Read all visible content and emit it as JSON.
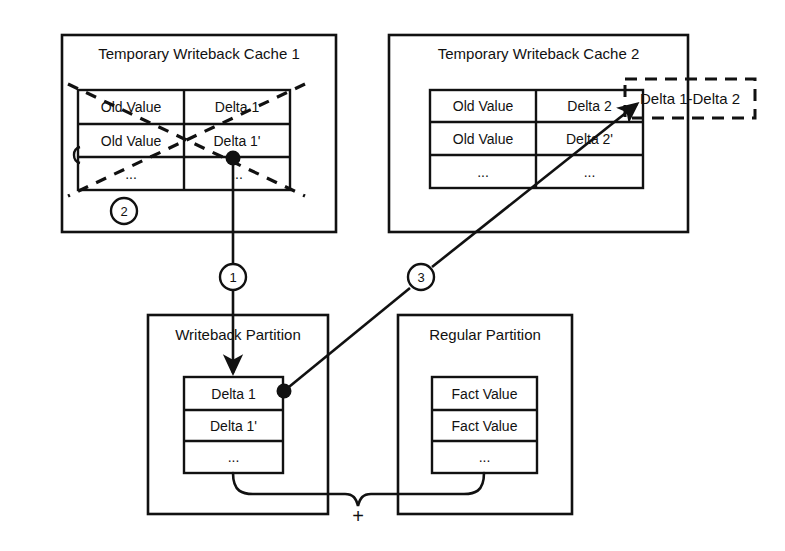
{
  "diagram": {
    "stroke_color": "#111111",
    "background_color": "#ffffff"
  },
  "caches": [
    {
      "id": "cache-1",
      "title": "Temporary Writeback Cache 1",
      "crossed_out": true,
      "step_badge": "2",
      "table": {
        "rows": [
          [
            "Old Value",
            "Delta 1"
          ],
          [
            "Old Value",
            "Delta 1'"
          ],
          [
            "...",
            "..."
          ]
        ]
      }
    },
    {
      "id": "cache-2",
      "title": "Temporary Writeback Cache 2",
      "crossed_out": false,
      "step_badge": null,
      "table": {
        "rows": [
          [
            "Old Value",
            "Delta 2"
          ],
          [
            "Old Value",
            "Delta 2'"
          ],
          [
            "...",
            "..."
          ]
        ]
      }
    }
  ],
  "dashed_callout": {
    "label": "Delta 1-Delta 2"
  },
  "partitions": [
    {
      "id": "writeback-partition",
      "title": "Writeback Partition",
      "table": {
        "rows": [
          "Delta 1",
          "Delta 1'",
          "..."
        ]
      }
    },
    {
      "id": "regular-partition",
      "title": "Regular Partition",
      "table": {
        "rows": [
          "Fact Value",
          "Fact Value",
          "..."
        ]
      }
    }
  ],
  "steps": [
    {
      "id": "step-1",
      "label": "1"
    },
    {
      "id": "step-2",
      "label": "2"
    },
    {
      "id": "step-3",
      "label": "3"
    }
  ],
  "merge": {
    "operator": "+"
  }
}
